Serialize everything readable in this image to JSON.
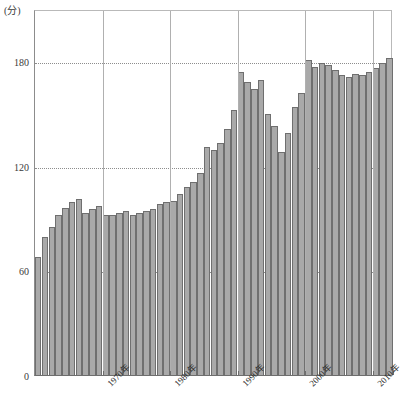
{
  "chart_data": {
    "type": "bar",
    "title": "",
    "subtitle": "",
    "unit_label": "(分)",
    "xlabel": "",
    "ylabel": "",
    "ylim": [
      0,
      210
    ],
    "yticks": [
      0,
      60,
      120,
      180
    ],
    "ytick_labels": [
      "0",
      "60",
      "120",
      "180"
    ],
    "grid": "horizontal-dotted",
    "legend": "none",
    "x_axis_type": "year",
    "x_tick_labels": [
      "1970年",
      "1980年",
      "1990年",
      "2000年",
      "2010年"
    ],
    "x_tick_years": [
      1970,
      1980,
      1990,
      2000,
      2010
    ],
    "categories": [
      1960,
      1961,
      1962,
      1963,
      1964,
      1965,
      1966,
      1967,
      1968,
      1969,
      1970,
      1971,
      1972,
      1973,
      1974,
      1975,
      1976,
      1977,
      1978,
      1979,
      1980,
      1981,
      1982,
      1983,
      1984,
      1985,
      1986,
      1987,
      1988,
      1989,
      1990,
      1991,
      1992,
      1993,
      1994,
      1995,
      1996,
      1997,
      1998,
      1999,
      2000,
      2001,
      2002,
      2003,
      2004,
      2005,
      2006,
      2007,
      2008,
      2009,
      2010,
      2011,
      2012
    ],
    "values": [
      68,
      79,
      85,
      92,
      96,
      99,
      101,
      93,
      95,
      97,
      92,
      92,
      93,
      94,
      92,
      93,
      94,
      95,
      98,
      99,
      100,
      104,
      108,
      111,
      116,
      131,
      129,
      133,
      141,
      152,
      174,
      168,
      164,
      169,
      150,
      143,
      128,
      139,
      154,
      162,
      181,
      177,
      179,
      178,
      175,
      172,
      171,
      173,
      172,
      174,
      176,
      179,
      182
    ],
    "bar_color": "#a9a9a9",
    "bar_edge_color": "#6f6f6f",
    "gridline_color": "#8d8d8d",
    "axis_color": "#6e6e6e"
  }
}
